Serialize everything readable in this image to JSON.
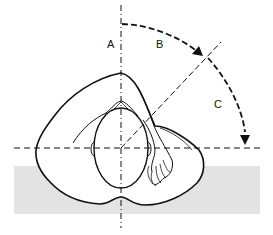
{
  "figure": {
    "labels": {
      "a": "A",
      "b": "B",
      "c": "C"
    },
    "colors": {
      "line": "#111111",
      "ground": "#e3e3e3",
      "background": "#ffffff"
    }
  }
}
